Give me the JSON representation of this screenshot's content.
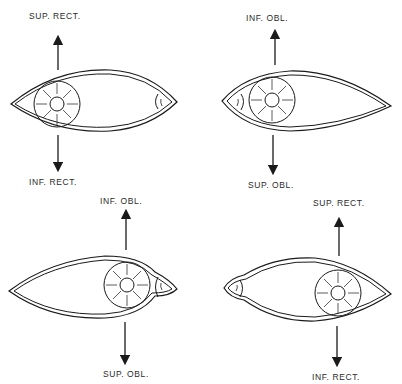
{
  "figure": {
    "panels": [
      {
        "id": "top-left",
        "top_label": "SUP. RECT.",
        "bottom_label": "INF. RECT.",
        "iris_position": "left",
        "caruncle_position": "right"
      },
      {
        "id": "top-right",
        "top_label": "INF. OBL.",
        "bottom_label": "SUP. OBL.",
        "iris_position": "left",
        "caruncle_position": "left"
      },
      {
        "id": "bottom-left",
        "top_label": "INF. OBL.",
        "bottom_label": "SUP. OBL.",
        "iris_position": "right",
        "caruncle_position": "right"
      },
      {
        "id": "bottom-right",
        "top_label": "SUP. RECT.",
        "bottom_label": "INF. RECT.",
        "iris_position": "right",
        "caruncle_position": "left"
      }
    ],
    "colors": {
      "line": "#1a1a1a",
      "background": "#ffffff"
    }
  }
}
